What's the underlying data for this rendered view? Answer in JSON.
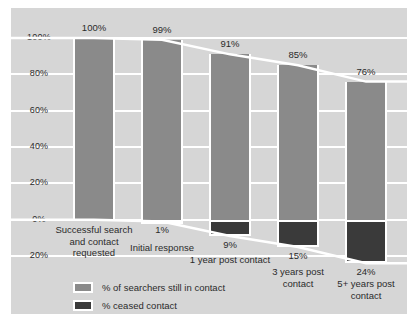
{
  "chart_data": {
    "type": "bar",
    "title": "",
    "subtitle": "",
    "xlabel": "",
    "ylabel": "",
    "grid": true,
    "legend_position": "bottom-left",
    "ylim": [
      -20,
      100
    ],
    "yticks": [
      "100%",
      "80%",
      "60%",
      "40%",
      "20%",
      "0%",
      "20%"
    ],
    "ytick_values": [
      100,
      80,
      60,
      40,
      20,
      0,
      -20
    ],
    "categories": [
      "Successful search and contact requested",
      "Initial response",
      "1 year post contact",
      "3 years post contact",
      "5+ years post contact"
    ],
    "series": [
      {
        "name": "% of searchers still in contact",
        "color": "#8a8a8a",
        "values": [
          100,
          99,
          91,
          85,
          76
        ],
        "labels": [
          "100%",
          "99%",
          "91%",
          "85%",
          "76%"
        ]
      },
      {
        "name": "% ceased contact",
        "color": "#3a3a3a",
        "values": [
          0,
          1,
          9,
          15,
          24
        ],
        "labels": [
          "",
          "1%",
          "9%",
          "15%",
          "24%"
        ]
      }
    ]
  },
  "legend": {
    "items": [
      {
        "label": "% of searchers still in contact",
        "color": "#8a8a8a"
      },
      {
        "label": "% ceased contact",
        "color": "#3a3a3a"
      }
    ]
  },
  "colors": {
    "plot_background": "#d6d6d6",
    "gridline": "#ffffff",
    "bar_positive": "#8a8a8a",
    "bar_negative": "#3a3a3a",
    "text": "#2b2b2b",
    "trend_line": "#ffffff"
  }
}
